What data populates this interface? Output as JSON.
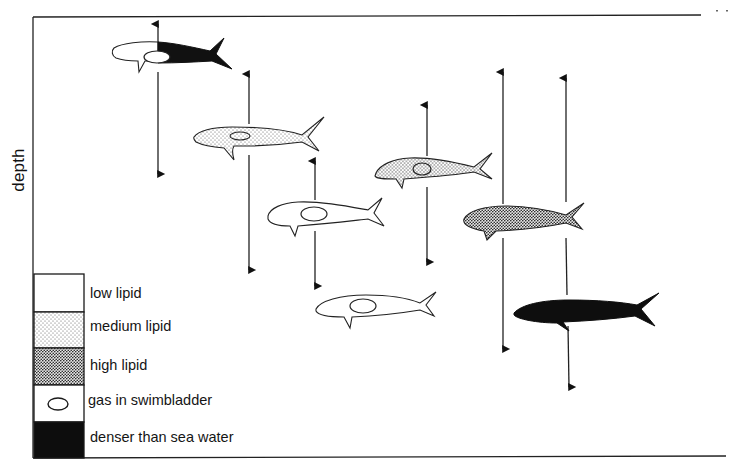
{
  "diagram": {
    "y_axis_label": "depth",
    "frame": {
      "left": 34,
      "top": 17,
      "right": 700,
      "bottom": 458
    },
    "legend": {
      "items": [
        {
          "key": "low_lipid",
          "label": "low lipid",
          "fill": "white"
        },
        {
          "key": "medium_lipid",
          "label": "medium lipid",
          "fill": "light-stipple"
        },
        {
          "key": "high_lipid",
          "label": "high lipid",
          "fill": "dense-stipple"
        },
        {
          "key": "gas",
          "label": "gas in swimbladder",
          "fill": "white-with-oval"
        },
        {
          "key": "dense",
          "label": "denser than sea water",
          "fill": "black"
        }
      ]
    },
    "fish": [
      {
        "id": 1,
        "type": "low lipid front + denser than sea water rear",
        "swimbladder": true,
        "x": 112,
        "y": 55,
        "arrow_x": 158,
        "arrow_top": 20,
        "arrow_bottom": 176
      },
      {
        "id": 2,
        "type": "medium lipid",
        "swimbladder": true,
        "x": 194,
        "y": 137,
        "arrow_x": 249,
        "arrow_top": 70,
        "arrow_bottom": 272
      },
      {
        "id": 3,
        "type": "low lipid",
        "swimbladder": true,
        "x": 268,
        "y": 215,
        "arrow_x": 315,
        "arrow_top": 157,
        "arrow_bottom": 288
      },
      {
        "id": 4,
        "type": "medium-high lipid",
        "swimbladder": true,
        "x": 374,
        "y": 172,
        "arrow_x": 427,
        "arrow_top": 101,
        "arrow_bottom": 264
      },
      {
        "id": 5,
        "type": "high lipid",
        "swimbladder": false,
        "x": 462,
        "y": 220,
        "arrow_x": 503,
        "arrow_top": 68,
        "arrow_bottom": 351
      },
      {
        "id": 6,
        "type": "low lipid",
        "swimbladder": true,
        "x": 316,
        "y": 307,
        "arrow_x": null
      },
      {
        "id": 7,
        "type": "denser than sea water",
        "swimbladder": false,
        "x": 513,
        "y": 311,
        "arrow_x": 569,
        "arrow_top": 74,
        "arrow_bottom": 389
      }
    ],
    "colors": {
      "ink": "#111111",
      "background": "#ffffff"
    }
  }
}
